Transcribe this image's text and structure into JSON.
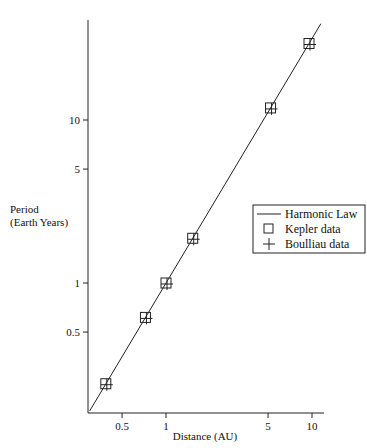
{
  "chart_data": {
    "type": "scatter",
    "title": "",
    "xlabel": "Distance (AU)",
    "ylabel_line1": "Period",
    "ylabel_line2": "(Earth Years)",
    "xscale": "log",
    "yscale": "log",
    "xlim": [
      0.3,
      11.5
    ],
    "ylim": [
      0.17,
      42
    ],
    "grid": false,
    "legend_position": "right-middle",
    "x_ticks": [
      {
        "value": 0.5,
        "label": "0.5"
      },
      {
        "value": 1,
        "label": "1"
      },
      {
        "value": 5,
        "label": "5"
      },
      {
        "value": 10,
        "label": "10"
      }
    ],
    "y_ticks": [
      {
        "value": 0.5,
        "label": "0.5"
      },
      {
        "value": 1,
        "label": "1"
      },
      {
        "value": 5,
        "label": "5"
      },
      {
        "value": 10,
        "label": "10"
      }
    ],
    "series": [
      {
        "name": "Harmonic Law",
        "kind": "line",
        "equation": "T = a^1.5",
        "x": [
          0.3,
          11.5
        ],
        "y": [
          0.164,
          39.0
        ]
      },
      {
        "name": "Kepler data",
        "kind": "marker-square",
        "x": [
          0.387,
          0.723,
          1.0,
          1.524,
          5.2,
          9.54
        ],
        "y": [
          0.241,
          0.615,
          1.0,
          1.881,
          11.86,
          29.46
        ]
      },
      {
        "name": "Boulliau data",
        "kind": "marker-plus",
        "x": [
          0.387,
          0.723,
          1.0,
          1.524,
          5.2,
          9.54
        ],
        "y": [
          0.241,
          0.615,
          1.0,
          1.881,
          11.86,
          29.46
        ]
      }
    ]
  },
  "legend": {
    "items": [
      {
        "label": "Harmonic Law",
        "symbol": "line"
      },
      {
        "label": "Kepler data",
        "symbol": "square"
      },
      {
        "label": "Boulliau data",
        "symbol": "plus"
      }
    ]
  },
  "colors": {
    "ink": "#111111",
    "background": "#ffffff"
  }
}
